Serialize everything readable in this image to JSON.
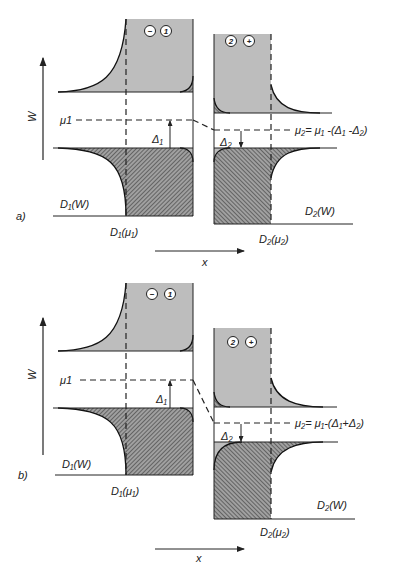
{
  "figure": {
    "axis_label_energy": "W",
    "axis_label_position": "x",
    "panels": [
      {
        "id": "a",
        "tag": "a)",
        "mu1_label": "μ1",
        "delta1_label": "Δ₁",
        "delta2_label": "Δ₂",
        "mu2_formula": "μ₂= μ₁ -(Δ₁ -Δ₂)",
        "electrode1_sign": "−",
        "electrode1_number": "1",
        "electrode2_number": "2",
        "electrode2_sign": "+",
        "d1_w_label": "D₁(W)",
        "d1_mu_label": "D₁(μ₁)",
        "d2_w_label": "D₂(W)",
        "d2_mu_label": "D₂(μ₂)"
      },
      {
        "id": "b",
        "tag": "b)",
        "mu1_label": "μ1",
        "delta1_label": "Δ₁",
        "delta2_label": "Δ₂",
        "mu2_formula": "μ₂= μ₁-(Δ₁+Δ₂)",
        "electrode1_sign": "−",
        "electrode1_number": "1",
        "electrode2_number": "2",
        "electrode2_sign": "+",
        "d1_w_label": "D₁(W)",
        "d1_mu_label": "D₁(μ₁)",
        "d2_w_label": "D₂(W)",
        "d2_mu_label": "D₂(μ₂)"
      }
    ],
    "colors": {
      "empty_states": "#bdbdbd",
      "occupied_hatch_bg": "#9a9a9a",
      "hatch_line": "#3a3a3a",
      "line": "#222222"
    }
  }
}
